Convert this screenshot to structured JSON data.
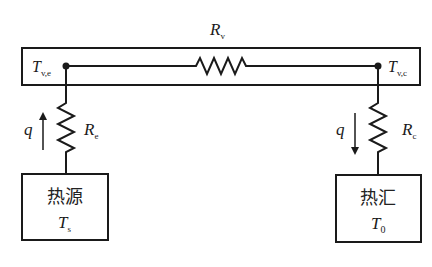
{
  "diagram": {
    "type": "thermal-resistance-network",
    "colors": {
      "line": "#1a1a1a",
      "background": "#ffffff"
    },
    "resistors": {
      "vapor": {
        "symbol": "R",
        "subscript": "v"
      },
      "evaporator": {
        "symbol": "R",
        "subscript": "e"
      },
      "condenser": {
        "symbol": "R",
        "subscript": "c"
      }
    },
    "nodes": {
      "evaporator_temp": {
        "symbol": "T",
        "subscript": "v,e"
      },
      "condenser_temp": {
        "symbol": "T",
        "subscript": "v,c"
      }
    },
    "heat_flow": {
      "left": {
        "symbol": "q",
        "direction": "up"
      },
      "right": {
        "symbol": "q",
        "direction": "down"
      }
    },
    "source_box": {
      "title": "热源",
      "temp_symbol": "T",
      "temp_subscript": "s"
    },
    "sink_box": {
      "title": "热汇",
      "temp_symbol": "T",
      "temp_subscript": "0"
    }
  }
}
